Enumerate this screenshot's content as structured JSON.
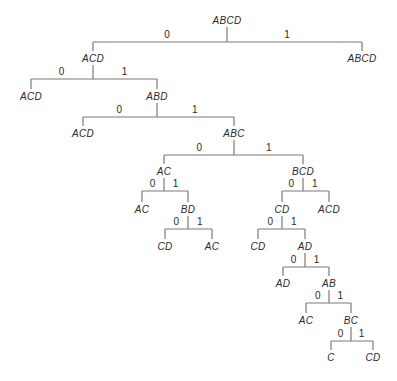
{
  "diagram": {
    "type": "binary-decision-tree",
    "nodes": [
      {
        "id": "n0",
        "label": "ABCD",
        "x": 227,
        "y": 20
      },
      {
        "id": "n1",
        "label": "ACD",
        "x": 93,
        "y": 58
      },
      {
        "id": "n2",
        "label": "ABCD",
        "x": 362,
        "y": 58
      },
      {
        "id": "n3",
        "label": "ACD",
        "x": 31,
        "y": 96
      },
      {
        "id": "n4",
        "label": "ABD",
        "x": 157,
        "y": 96
      },
      {
        "id": "n5",
        "label": "ACD",
        "x": 83,
        "y": 133
      },
      {
        "id": "n6",
        "label": "ABC",
        "x": 234,
        "y": 133
      },
      {
        "id": "n7",
        "label": "AC",
        "x": 164,
        "y": 171
      },
      {
        "id": "n8",
        "label": "BCD",
        "x": 303,
        "y": 171
      },
      {
        "id": "n9",
        "label": "AC",
        "x": 142,
        "y": 209
      },
      {
        "id": "n10",
        "label": "BD",
        "x": 188,
        "y": 209
      },
      {
        "id": "n11",
        "label": "CD",
        "x": 282,
        "y": 209
      },
      {
        "id": "n12",
        "label": "ACD",
        "x": 329,
        "y": 209
      },
      {
        "id": "n13",
        "label": "CD",
        "x": 165,
        "y": 246
      },
      {
        "id": "n14",
        "label": "AC",
        "x": 212,
        "y": 246
      },
      {
        "id": "n15",
        "label": "CD",
        "x": 258,
        "y": 246
      },
      {
        "id": "n16",
        "label": "AD",
        "x": 305,
        "y": 246
      },
      {
        "id": "n17",
        "label": "AD",
        "x": 283,
        "y": 283
      },
      {
        "id": "n18",
        "label": "AB",
        "x": 329,
        "y": 283
      },
      {
        "id": "n19",
        "label": "AC",
        "x": 306,
        "y": 320
      },
      {
        "id": "n20",
        "label": "BC",
        "x": 351,
        "y": 320
      },
      {
        "id": "n21",
        "label": "C",
        "x": 331,
        "y": 357
      },
      {
        "id": "n22",
        "label": "CD",
        "x": 373,
        "y": 357
      }
    ],
    "splits": [
      {
        "parent": "n0",
        "bar_y": 42,
        "left": "n1",
        "right": "n2",
        "left_label": "0",
        "right_label": "1"
      },
      {
        "parent": "n1",
        "bar_y": 79,
        "left": "n3",
        "right": "n4",
        "left_label": "0",
        "right_label": "1"
      },
      {
        "parent": "n4",
        "bar_y": 117,
        "left": "n5",
        "right": "n6",
        "left_label": "0",
        "right_label": "1"
      },
      {
        "parent": "n6",
        "bar_y": 155,
        "left": "n7",
        "right": "n8",
        "left_label": "0",
        "right_label": "1"
      },
      {
        "parent": "n7",
        "bar_y": 191,
        "left": "n9",
        "right": "n10",
        "left_label": "0",
        "right_label": "1"
      },
      {
        "parent": "n8",
        "bar_y": 191,
        "left": "n11",
        "right": "n12",
        "left_label": "0",
        "right_label": "1"
      },
      {
        "parent": "n10",
        "bar_y": 229,
        "left": "n13",
        "right": "n14",
        "left_label": "0",
        "right_label": "1"
      },
      {
        "parent": "n11",
        "bar_y": 229,
        "left": "n15",
        "right": "n16",
        "left_label": "0",
        "right_label": "1"
      },
      {
        "parent": "n16",
        "bar_y": 267,
        "left": "n17",
        "right": "n18",
        "left_label": "0",
        "right_label": "1"
      },
      {
        "parent": "n18",
        "bar_y": 303,
        "left": "n19",
        "right": "n20",
        "left_label": "0",
        "right_label": "1"
      },
      {
        "parent": "n20",
        "bar_y": 341,
        "left": "n21",
        "right": "n22",
        "left_label": "0",
        "right_label": "1"
      }
    ],
    "colors": {
      "line": "#7a7a7a",
      "text": "#2a2a2a",
      "background": "#ffffff"
    }
  }
}
